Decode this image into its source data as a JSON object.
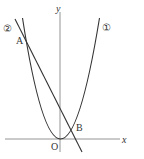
{
  "diagram": {
    "type": "coordinate-graph",
    "axes": {
      "x_label": "x",
      "y_label": "y",
      "origin_label": "O"
    },
    "curves": [
      {
        "id": "parabola",
        "marker": "①",
        "kind": "parabola",
        "vertex": "O"
      },
      {
        "id": "line",
        "marker": "②",
        "kind": "line"
      }
    ],
    "points": [
      {
        "label": "A",
        "description": "intersection of ① and ② (left, upper)"
      },
      {
        "label": "B",
        "description": "intersection of ① and ② (right, lower)"
      }
    ],
    "colors": {
      "stroke": "#333333",
      "axis": "#777777",
      "background": "#ffffff"
    }
  }
}
